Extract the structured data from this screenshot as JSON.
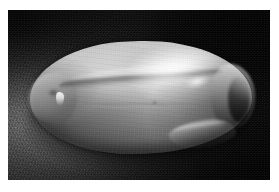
{
  "page": {
    "background_color": "#ffffff",
    "width": 279,
    "height": 192,
    "caption": ""
  },
  "figure": {
    "kind": "photograph",
    "subtype": "grayscale-macro-photograph",
    "title": "",
    "plate": {
      "left": 8,
      "top": 10,
      "width": 262,
      "height": 170,
      "border_color": "#ffffff",
      "background_color": "#050505"
    },
    "background": {
      "description": "dark speckled granular substrate, brightest toward the mid-left and lower-left, fading to near-black at the top-right and bottom-right corners",
      "lightest_color": "#969696",
      "mid_color": "#3a3a3a",
      "darkest_color": "#010101",
      "texture": "fine speckle / film grain"
    },
    "lighting": {
      "key_light_direction": "upper-left",
      "specular_highlight_position": "upper-right of subject",
      "cast_shadow": "dark pooled shadow beneath and to the lower-left of the subject"
    },
    "subject": {
      "name": "seed",
      "description": "single elongated ovoid seed lying on its side, long axis roughly horizontal, blunt rounded left end with a small notch, tapering rounded right tip",
      "orientation": "horizontal, tilted about -1.5 degrees",
      "surface": "smooth, slightly glossy, faintly mottled",
      "body_color_light": "#d6d6d6",
      "body_color_mid": "#ababab",
      "body_color_dark": "#2e2e2e",
      "features": [
        {
          "name": "dorsal-crease",
          "description": "long curving suture/groove running along the upper third of the seed from the left lobe to the right shoulder"
        },
        {
          "name": "specular-highlight",
          "description": "broad bright sheen across the upper-right back of the seed"
        },
        {
          "name": "secondary-highlight",
          "description": "small hot-spot on the right shoulder"
        },
        {
          "name": "left-lobe",
          "description": "blunt rounded left end forming a separate lobe with a shallow notch"
        },
        {
          "name": "white-blemish",
          "description": "small bright vertical mark on the left flank"
        },
        {
          "name": "right-tip",
          "description": "tapered right end edged by a dark separating line"
        },
        {
          "name": "lower-fold",
          "description": "overlapping fold along the lower-right margin of the seed"
        },
        {
          "name": "midline-groove",
          "description": "faint horizontal groove across the lower belly"
        },
        {
          "name": "dark-fleck",
          "description": "small dark speck near the centre of the belly"
        }
      ]
    },
    "palette": {
      "paper_white": "#ffffff",
      "plate_black": "#050505",
      "highlight_white": "#ffffff",
      "seed_light_gray": "#d6d6d6",
      "seed_mid_gray": "#ababab",
      "seed_dark_gray": "#565656",
      "shadow_black": "#000000",
      "substrate_gray": "#696969"
    }
  }
}
